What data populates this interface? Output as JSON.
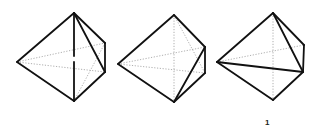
{
  "figure": {
    "label": "1",
    "colors": {
      "solid_edge": "#111111",
      "hidden_edge": "#9a9a9a",
      "background": "#ffffff"
    },
    "views": [
      {
        "id": "view-1",
        "vertices": {
          "top": [
            74,
            13
          ],
          "left": [
            17,
            62
          ],
          "bottom": [
            74,
            101
          ],
          "right_upper": [
            105,
            43
          ],
          "right_lower": [
            105,
            72
          ]
        },
        "solid_edges": [
          [
            "left",
            "top"
          ],
          [
            "left",
            "bottom"
          ],
          [
            "top",
            "right_upper"
          ],
          [
            "right_upper",
            "right_lower"
          ],
          [
            "right_lower",
            "bottom"
          ],
          [
            "top",
            "right_lower"
          ],
          [
            "top",
            "bottom"
          ]
        ],
        "hidden_edges": [
          [
            "left",
            "right_upper"
          ],
          [
            "left",
            "right_lower"
          ],
          [
            "right_upper",
            "bottom"
          ]
        ]
      },
      {
        "id": "view-2",
        "vertices": {
          "top": [
            174,
            15
          ],
          "left": [
            118,
            64
          ],
          "bottom": [
            174,
            102
          ],
          "right_upper": [
            205,
            47
          ],
          "right_lower": [
            205,
            73
          ]
        },
        "solid_edges": [
          [
            "left",
            "top"
          ],
          [
            "left",
            "bottom"
          ],
          [
            "top",
            "right_upper"
          ],
          [
            "right_upper",
            "right_lower"
          ],
          [
            "right_lower",
            "bottom"
          ],
          [
            "bottom",
            "right_upper"
          ]
        ],
        "hidden_edges": [
          [
            "left",
            "right_upper"
          ],
          [
            "left",
            "right_lower"
          ],
          [
            "top",
            "bottom"
          ],
          [
            "top",
            "right_lower"
          ]
        ]
      },
      {
        "id": "view-3",
        "vertices": {
          "top": [
            273,
            13
          ],
          "left": [
            217,
            62
          ],
          "bottom": [
            273,
            100
          ],
          "right_upper": [
            304,
            45
          ],
          "right_lower": [
            303,
            72
          ]
        },
        "solid_edges": [
          [
            "left",
            "top"
          ],
          [
            "left",
            "bottom"
          ],
          [
            "top",
            "right_upper"
          ],
          [
            "right_upper",
            "right_lower"
          ],
          [
            "right_lower",
            "bottom"
          ],
          [
            "top",
            "right_lower"
          ],
          [
            "left",
            "right_lower"
          ]
        ],
        "hidden_edges": [
          [
            "left",
            "right_upper"
          ],
          [
            "top",
            "bottom"
          ]
        ]
      }
    ]
  }
}
